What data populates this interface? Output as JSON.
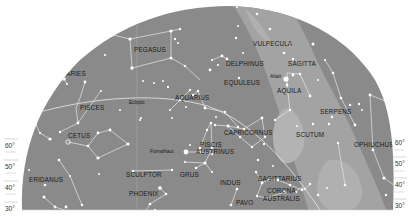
{
  "map": {
    "type": "star-chart-southern-horizon",
    "colors": {
      "sky": "#8a8a8a",
      "milky_way": "#a3a3a3",
      "milky_way_inner": "#b3b3b3",
      "stars": "#ffffff",
      "lines": "#e6e6e6",
      "label": "#1a1a1a",
      "background": "#ffffff"
    },
    "constellations": [
      {
        "name": "PEGASUS",
        "x": 134,
        "y": 49
      },
      {
        "name": "VULPECULA",
        "x": 253,
        "y": 44
      },
      {
        "name": "DELPHINUS",
        "x": 226,
        "y": 64
      },
      {
        "name": "SAGITTA",
        "x": 288,
        "y": 64
      },
      {
        "name": "ARIES",
        "x": 66,
        "y": 74
      },
      {
        "name": "EQUULEUS",
        "x": 224,
        "y": 83
      },
      {
        "name": "AQUILA",
        "x": 278,
        "y": 91
      },
      {
        "name": "AQUARIUS",
        "x": 175,
        "y": 98
      },
      {
        "name": "PISCES",
        "x": 80,
        "y": 108
      },
      {
        "name": "SERPENS",
        "x": 321,
        "y": 112
      },
      {
        "name": "CAPRICORNUS",
        "x": 236,
        "y": 133
      },
      {
        "name": "SCUTUM",
        "x": 296,
        "y": 135
      },
      {
        "name": "CETUS",
        "x": 68,
        "y": 136
      },
      {
        "name": "OPHIUCHUS",
        "x": 368,
        "y": 145
      },
      {
        "name": "PISCIS",
        "x": 192,
        "y": 145
      },
      {
        "name": "AUSTRINUS",
        "x": 188,
        "y": 152
      },
      {
        "name": "SCULPTOR",
        "x": 129,
        "y": 177
      },
      {
        "name": "GRUS",
        "x": 184,
        "y": 176
      },
      {
        "name": "SAGITTARIUS",
        "x": 262,
        "y": 180
      },
      {
        "name": "ERIDANUS",
        "x": 30,
        "y": 180
      },
      {
        "name": "INDUS",
        "x": 224,
        "y": 184
      },
      {
        "name": "CORONA",
        "x": 266,
        "y": 191
      },
      {
        "name": "PHOENIX",
        "x": 130,
        "y": 195
      },
      {
        "name": "AUSTRALIS",
        "x": 262,
        "y": 199
      },
      {
        "name": "PAVO",
        "x": 238,
        "y": 203
      }
    ],
    "star_labels": [
      {
        "name": "Altair",
        "x": 272,
        "y": 77
      },
      {
        "name": "Fomalhaut",
        "x": 152,
        "y": 152
      }
    ],
    "ecliptic_label": {
      "name": "Ecliptic",
      "x": 131,
      "y": 102
    },
    "altitude_scale_left": [
      {
        "label": "60°",
        "y": 146
      },
      {
        "label": "50°",
        "y": 167
      },
      {
        "label": "40°",
        "y": 188
      },
      {
        "label": "30°",
        "y": 209
      }
    ],
    "altitude_scale_right": [
      {
        "label": "60°",
        "y": 143
      },
      {
        "label": "50°",
        "y": 164
      },
      {
        "label": "40°",
        "y": 185
      },
      {
        "label": "30°",
        "y": 206
      }
    ]
  }
}
